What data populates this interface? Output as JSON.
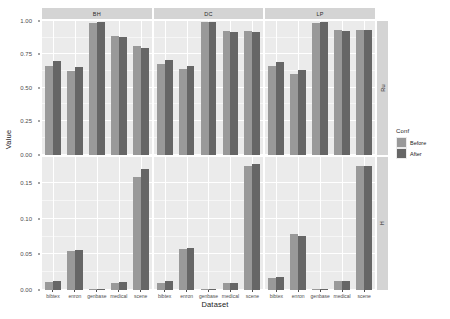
{
  "chart_data": {
    "type": "bar",
    "title": "",
    "xlabel": "Dataset",
    "ylabel": "Value",
    "grid": true,
    "legend_position": "right",
    "legend_title": "Conf",
    "categories": [
      "bibtex",
      "enron",
      "genbase",
      "medical",
      "scene"
    ],
    "facet_cols": [
      "BH",
      "DC",
      "LP"
    ],
    "facet_rows": [
      "Ru",
      "H"
    ],
    "row_axis": [
      {
        "row": "Ru",
        "ylim": [
          0,
          1.0
        ],
        "ticks": [
          "0.00",
          "0.25",
          "0.50",
          "0.75",
          "1.00"
        ],
        "tick_values": [
          0,
          0.25,
          0.5,
          0.75,
          1.0
        ]
      },
      {
        "row": "H",
        "ylim": [
          0,
          0.1875
        ],
        "ticks": [
          "0.00",
          "0.05",
          "0.10",
          "0.15"
        ],
        "tick_values": [
          0,
          0.05,
          0.1,
          0.15
        ]
      }
    ],
    "series": [
      {
        "name": "Before",
        "color": "#999999"
      },
      {
        "name": "After",
        "color": "#666666"
      }
    ],
    "panels": [
      {
        "facet_row": "Ru",
        "facet_col": "BH",
        "values": {
          "Before": [
            0.665,
            0.625,
            0.985,
            0.885,
            0.815
          ],
          "After": [
            0.7,
            0.655,
            0.99,
            0.88,
            0.8
          ]
        }
      },
      {
        "facet_row": "Ru",
        "facet_col": "DC",
        "values": {
          "Before": [
            0.675,
            0.64,
            0.99,
            0.925,
            0.925
          ],
          "After": [
            0.705,
            0.665,
            0.995,
            0.92,
            0.92
          ]
        }
      },
      {
        "facet_row": "Ru",
        "facet_col": "LP",
        "values": {
          "Before": [
            0.66,
            0.605,
            0.985,
            0.93,
            0.93
          ],
          "After": [
            0.69,
            0.63,
            0.99,
            0.925,
            0.93
          ]
        }
      },
      {
        "facet_row": "H",
        "facet_col": "BH",
        "values": {
          "Before": [
            0.0115,
            0.055,
            0.0018,
            0.0105,
            0.1585
          ],
          "After": [
            0.013,
            0.0565,
            0.0018,
            0.0115,
            0.17
          ]
        }
      },
      {
        "facet_row": "H",
        "facet_col": "DC",
        "values": {
          "Before": [
            0.0105,
            0.058,
            0.0012,
            0.01,
            0.174
          ],
          "After": [
            0.012,
            0.0585,
            0.0012,
            0.0105,
            0.1765
          ]
        }
      },
      {
        "facet_row": "H",
        "facet_col": "LP",
        "values": {
          "Before": [
            0.0175,
            0.078,
            0.0012,
            0.012,
            0.174
          ],
          "After": [
            0.0185,
            0.076,
            0.0012,
            0.0125,
            0.1745
          ]
        }
      }
    ]
  },
  "axis": {
    "ylabel": "Value",
    "xlabel": "Dataset"
  },
  "legend": {
    "title": "Conf",
    "items": [
      {
        "label": "Before",
        "color": "#999999"
      },
      {
        "label": "After",
        "color": "#666666"
      }
    ]
  },
  "strips": {
    "top": [
      "BH",
      "DC",
      "LP"
    ],
    "right": [
      "Ru",
      "H"
    ]
  },
  "xticks": [
    "bibtex",
    "enron",
    "genbase",
    "medical",
    "scene"
  ],
  "yticks_top": [
    "1.00",
    "0.75",
    "0.50",
    "0.25",
    "0.00"
  ],
  "yticks_bottom": [
    "0.15",
    "0.10",
    "0.05",
    "0.00"
  ]
}
